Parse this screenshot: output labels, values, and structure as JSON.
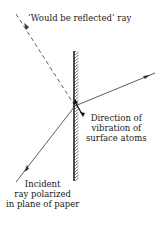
{
  "diagram": {
    "labels": {
      "reflected": "‘Would be reflected’ ray",
      "vibration_line1": "Direction of",
      "vibration_line2": "vibration of",
      "vibration_line3": "surface atoms",
      "incident_line1": "Incident",
      "incident_line2": "ray polarized",
      "incident_line3": "in plane of paper"
    },
    "colors": {
      "line": "#333333",
      "background": "#ffffff"
    }
  }
}
